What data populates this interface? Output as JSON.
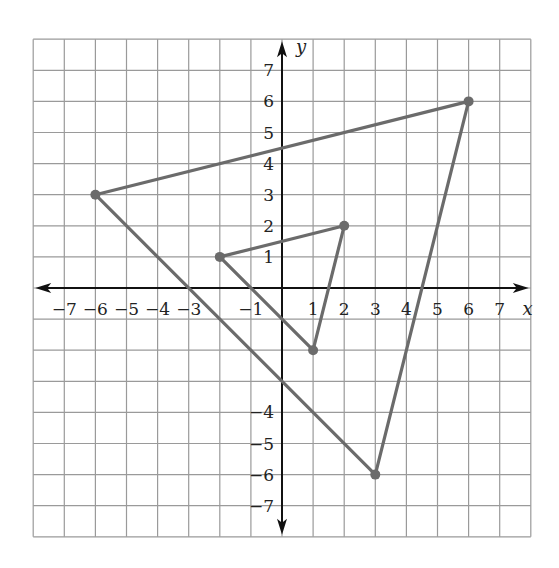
{
  "figure": {
    "title": "",
    "axes": {
      "x_label": "x",
      "y_label": "y",
      "x_range": [
        -8,
        8
      ],
      "y_range": [
        -8,
        8
      ],
      "grid": true,
      "x_tick_labels": [
        "−7",
        "−6",
        "−5",
        "−4",
        "−3",
        "−1",
        "1",
        "2",
        "3",
        "4",
        "5",
        "6",
        "7"
      ],
      "x_tick_values": [
        -7,
        -6,
        -5,
        -4,
        -3,
        -1,
        1,
        2,
        3,
        4,
        5,
        6,
        7
      ],
      "y_tick_labels": [
        "7",
        "6",
        "5",
        "4",
        "3",
        "2",
        "1",
        "−4",
        "−5",
        "−6",
        "−7"
      ],
      "y_tick_values": [
        7,
        6,
        5,
        4,
        3,
        2,
        1,
        -4,
        -5,
        -6,
        -7
      ]
    },
    "colors": {
      "grid": "#9a9a9a",
      "axis": "#111111",
      "shape": "#6b6b6b"
    },
    "shapes": [
      {
        "name": "small-triangle",
        "vertices": [
          [
            -2,
            1
          ],
          [
            2,
            2
          ],
          [
            1,
            -2
          ]
        ]
      },
      {
        "name": "large-triangle",
        "vertices": [
          [
            -6,
            3
          ],
          [
            6,
            6
          ],
          [
            3,
            -6
          ]
        ]
      }
    ]
  }
}
